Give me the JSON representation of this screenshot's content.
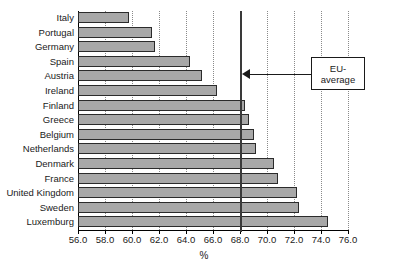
{
  "chart_data": {
    "type": "bar",
    "orientation": "horizontal",
    "title": "",
    "xlabel": "%",
    "ylabel": "",
    "xlim": [
      56.0,
      76.0
    ],
    "xticks": [
      "56.0",
      "58.0",
      "60.0",
      "62.0",
      "64.0",
      "66.0",
      "68.0",
      "70.0",
      "72.0",
      "74.0",
      "76.0"
    ],
    "grid": "vertical-dotted",
    "legend": "none",
    "categories": [
      "Italy",
      "Portugal",
      "Germany",
      "Spain",
      "Austria",
      "Ireland",
      "Finland",
      "Greece",
      "Belgium",
      "Netherlands",
      "Denmark",
      "France",
      "United Kingdom",
      "Sweden",
      "Luxemburg"
    ],
    "values": [
      59.8,
      61.5,
      61.7,
      64.3,
      65.2,
      66.3,
      68.4,
      68.7,
      69.0,
      69.2,
      70.5,
      70.8,
      72.2,
      72.4,
      74.5
    ],
    "annotations": [
      {
        "label": "EU-\naverage",
        "line1": "EU-",
        "line2": "average",
        "type": "reference-line",
        "value": 68.1
      }
    ],
    "colors": {
      "bar_fill": "#a8a8a8",
      "bar_stroke": "#2b2b2b",
      "grid": "#8a8a8a",
      "reference_line": "#3a3a3a",
      "axis": "#000000",
      "background": "#ffffff"
    }
  }
}
